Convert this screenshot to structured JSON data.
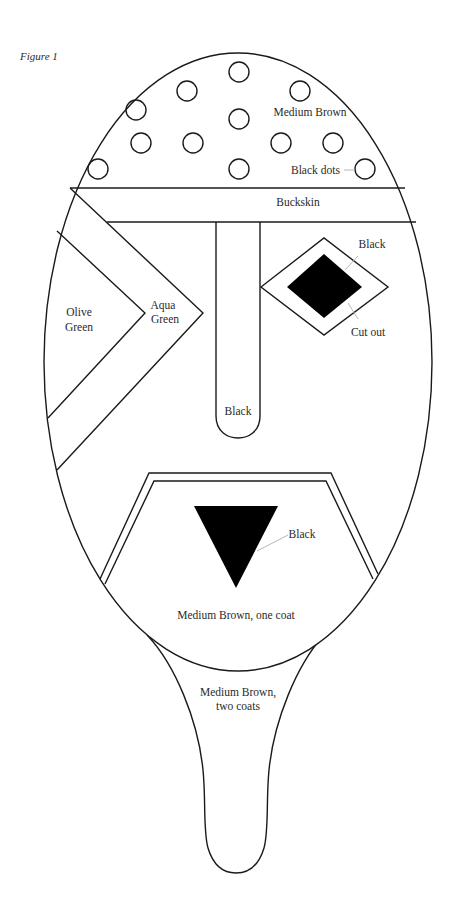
{
  "figure": {
    "caption": "Figure 1",
    "line_color": "#1a1a1a",
    "leader_color": "#b8b8b8"
  },
  "regions": {
    "forehead": {
      "label": "Medium Brown"
    },
    "dots": {
      "label": "Black dots",
      "count": 12
    },
    "band": {
      "label": "Buckskin"
    },
    "left_inner": {
      "label_line1": "Olive",
      "label_line2": "Green"
    },
    "left_chevron": {
      "label_line1": "Aqua",
      "label_line2": "Green"
    },
    "eye_outer": {
      "label": "Black"
    },
    "eye_inner": {
      "label": "Cut out"
    },
    "nose": {
      "label": "Black"
    },
    "mouth_triangle": {
      "label": "Black"
    },
    "lower_face": {
      "label": "Medium Brown, one coat"
    },
    "handle": {
      "label_line1": "Medium Brown,",
      "label_line2": "two coats"
    }
  }
}
